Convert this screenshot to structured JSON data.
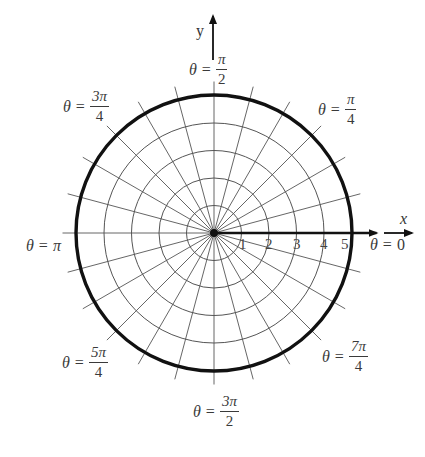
{
  "diagram": {
    "title": "",
    "type": "polar-grid",
    "center_px": [
      214,
      233
    ],
    "ring_radius_px": 27.5,
    "rings": [
      1,
      2,
      3,
      4,
      5
    ],
    "spoke_step_deg": 15,
    "spoke_count": 24,
    "highlighted_curve": {
      "type": "circle",
      "r": 5,
      "stroke": "#111111"
    },
    "colors": {
      "grid": "#555555",
      "axis": "#111111",
      "curve": "#111111",
      "text": "#3a3a3a"
    }
  },
  "axes": {
    "x_label": "x",
    "y_label": "y",
    "radial_ticks": [
      "1",
      "2",
      "3",
      "4",
      "5"
    ]
  },
  "angle_labels": [
    {
      "id": "theta-0",
      "theta": "θ",
      "eq": "=",
      "value": "0",
      "num": "",
      "den": ""
    },
    {
      "id": "theta-pi-4",
      "theta": "θ",
      "eq": "=",
      "value": "",
      "num": "π",
      "den": "4"
    },
    {
      "id": "theta-pi-2",
      "theta": "θ",
      "eq": "=",
      "value": "",
      "num": "π",
      "den": "2"
    },
    {
      "id": "theta-3pi-4",
      "theta": "θ",
      "eq": "=",
      "value": "",
      "num": "3π",
      "den": "4"
    },
    {
      "id": "theta-pi",
      "theta": "θ",
      "eq": "=",
      "value": "π",
      "num": "",
      "den": ""
    },
    {
      "id": "theta-5pi-4",
      "theta": "θ",
      "eq": "=",
      "value": "",
      "num": "5π",
      "den": "4"
    },
    {
      "id": "theta-3pi-2",
      "theta": "θ",
      "eq": "=",
      "value": "",
      "num": "3π",
      "den": "2"
    },
    {
      "id": "theta-7pi-4",
      "theta": "θ",
      "eq": "=",
      "value": "",
      "num": "7π",
      "den": "4"
    }
  ]
}
